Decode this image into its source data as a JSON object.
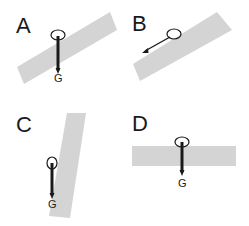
{
  "diagram": {
    "type": "physics-free-body-panels",
    "panels": [
      {
        "id": "A",
        "label": "A",
        "force_label": "G",
        "surface_angle_deg": -33,
        "force_direction": "vertical-down"
      },
      {
        "id": "B",
        "label": "B",
        "force_label": "",
        "surface_angle_deg": -33,
        "force_direction": "down-left-along-incline"
      },
      {
        "id": "C",
        "label": "C",
        "force_label": "G",
        "surface_angle_deg": -80,
        "force_direction": "vertical-down"
      },
      {
        "id": "D",
        "label": "D",
        "force_label": "G",
        "surface_angle_deg": 0,
        "force_direction": "vertical-down"
      }
    ],
    "colors": {
      "surface": "#d4d4d4",
      "arrow": "#1a1a1a",
      "text": "#1a1a1a"
    }
  }
}
